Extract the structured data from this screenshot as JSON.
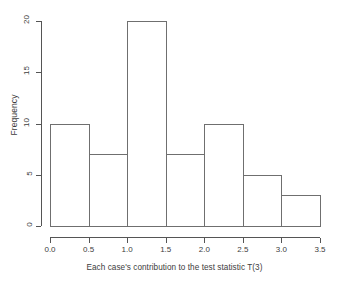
{
  "chart_data": {
    "type": "bar",
    "subtype": "histogram",
    "title": "",
    "xlabel": "Each case's contribution to the test statistic T(3)",
    "ylabel": "Frequency",
    "categories": [
      "0.0-0.5",
      "0.5-1.0",
      "1.0-1.5",
      "1.5-2.0",
      "2.0-2.5",
      "2.5-3.0",
      "3.0-3.5"
    ],
    "bin_edges": [
      0.0,
      0.5,
      1.0,
      1.5,
      2.0,
      2.5,
      3.0,
      3.5
    ],
    "bin_width": 0.5,
    "values": [
      10,
      7,
      20,
      7,
      10,
      5,
      3
    ],
    "xlim": [
      0.0,
      3.5
    ],
    "ylim": [
      0,
      20
    ],
    "xticks": [
      0.0,
      0.5,
      1.0,
      1.5,
      2.0,
      2.5,
      3.0,
      3.5
    ],
    "xtick_labels": [
      "0.0",
      "0.5",
      "1.0",
      "1.5",
      "2.0",
      "2.5",
      "3.0",
      "3.5"
    ],
    "yticks": [
      0,
      5,
      10,
      15,
      20
    ],
    "ytick_labels": [
      "0",
      "5",
      "10",
      "15",
      "20"
    ],
    "grid": false,
    "legend": false,
    "legend_position": "none",
    "bar_fill": "#ffffff",
    "bar_border": "#6f6f6f",
    "axis_color": "#555555",
    "text_color": "#3d3d3d",
    "background": "#ffffff"
  }
}
